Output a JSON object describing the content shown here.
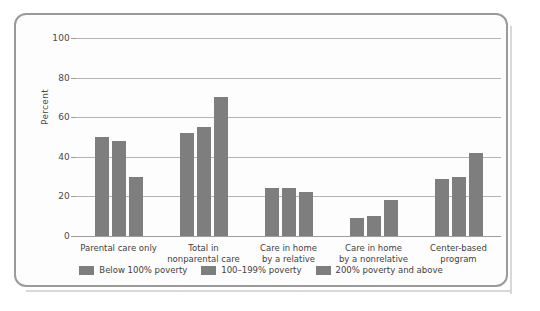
{
  "chart_data": {
    "type": "bar",
    "title": "",
    "xlabel": "",
    "ylabel": "Percent",
    "ylim": [
      0,
      100
    ],
    "yticks": [
      0,
      20,
      40,
      60,
      80,
      100
    ],
    "grid": true,
    "legend_position": "bottom",
    "categories": [
      "Parental care only",
      "Total in\nnonparental care",
      "Care in home\nby a relative",
      "Care in home\nby a nonrelative",
      "Center-based\nprogram"
    ],
    "category_lines": [
      [
        "Parental care only"
      ],
      [
        "Total in",
        "nonparental care"
      ],
      [
        "Care in home",
        "by a relative"
      ],
      [
        "Care in home",
        "by a nonrelative"
      ],
      [
        "Center-based",
        "program"
      ]
    ],
    "series": [
      {
        "name": "Below 100% poverty",
        "color": "#7e7e7e",
        "values": [
          50,
          52,
          24,
          9,
          29
        ]
      },
      {
        "name": "100–199% poverty",
        "color": "#7e7e7e",
        "values": [
          48,
          55,
          24,
          10,
          30
        ]
      },
      {
        "name": "200% poverty and above",
        "color": "#7e7e7e",
        "values": [
          30,
          70,
          22,
          18,
          42
        ]
      }
    ]
  },
  "legend": {
    "items": [
      {
        "label": "Below 100% poverty"
      },
      {
        "label": "100–199% poverty"
      },
      {
        "label": "200% poverty and above"
      }
    ]
  },
  "axis": {
    "y_label": "Percent",
    "y_ticks": [
      "0",
      "20",
      "40",
      "60",
      "80",
      "100"
    ]
  },
  "colors": {
    "bar": "#7e7e7e",
    "gridline": "#b4b4b4",
    "frame": "#9a9a9a",
    "text": "#3f3f3f"
  }
}
